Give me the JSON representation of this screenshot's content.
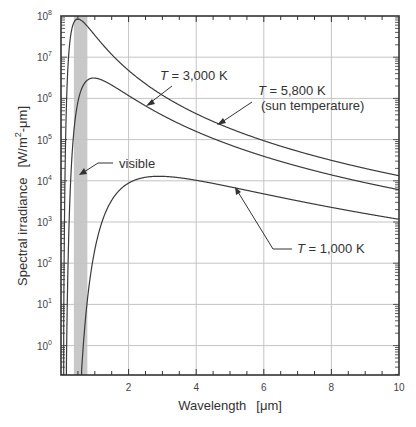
{
  "chart_data": {
    "type": "line",
    "title": "",
    "xlabel": "Wavelength  [μm]",
    "ylabel": "Spectral irradiance  [W/m²-μm]",
    "xscale": "linear",
    "yscale": "log",
    "xlim": [
      0,
      10
    ],
    "ylim": [
      0.2,
      100000000
    ],
    "x_ticks": [
      2,
      4,
      6,
      8,
      10
    ],
    "x_tick_labels": [
      "2",
      "4",
      "6",
      "8",
      "10"
    ],
    "y_ticks": [
      1,
      10,
      100,
      1000,
      10000,
      100000,
      1000000,
      10000000,
      100000000
    ],
    "y_tick_labels": [
      "10^0",
      "10^1",
      "10^2",
      "10^3",
      "10^4",
      "10^5",
      "10^6",
      "10^7",
      "10^8"
    ],
    "grid": true,
    "legend": "none (inline annotations)",
    "series": [
      {
        "name": "T = 5,800 K (sun temperature)",
        "temperature_K": 5800,
        "x": [
          0.2,
          0.3,
          0.4,
          0.5,
          0.6,
          0.8,
          1,
          1.5,
          2,
          3,
          4,
          5,
          6,
          7,
          8,
          9,
          10
        ],
        "values": [
          5200000.0,
          38000000.0,
          61000000.0,
          63000000.0,
          56000000.0,
          37000000.0,
          24000000.0,
          8400000.0,
          3600000.0,
          960000.0,
          360000.0,
          160000.0,
          82000.0,
          46000.0,
          28000.0,
          18000.0,
          12000.0
        ]
      },
      {
        "name": "T = 3,000 K",
        "temperature_K": 3000,
        "x": [
          0.3,
          0.4,
          0.5,
          0.6,
          0.8,
          1,
          1.5,
          2,
          3,
          4,
          5,
          6,
          7,
          8,
          9,
          10
        ],
        "values": [
          50000.0,
          640000.0,
          1800000.0,
          2700000.0,
          3100000.0,
          2600000.0,
          1300000.0,
          650000.0,
          210000.0,
          86000.0,
          41000.0,
          22000.0,
          13000.0,
          8200.0,
          5400.0,
          3700.0
        ]
      },
      {
        "name": "T = 1,000 K",
        "temperature_K": 1000,
        "x": [
          0.6,
          0.8,
          1,
          1.5,
          2,
          2.9,
          3,
          4,
          5,
          6,
          7,
          8,
          9,
          10
        ],
        "values": [
          0.3,
          60,
          700,
          5400.0,
          10000.0,
          12800.0,
          12700.0,
          10500.0,
          7700.0,
          5400.0,
          3900.0,
          2800.0,
          2100.0,
          1600.0
        ]
      }
    ],
    "shaded_regions": [
      {
        "name": "visible",
        "x_range": [
          0.38,
          0.78
        ],
        "color": "#c8c8c8"
      }
    ],
    "annotations": [
      {
        "text": "T = 3,000 K",
        "target_series": "T = 3,000 K"
      },
      {
        "text": "T = 5,800 K",
        "subtext": "(sun temperature)",
        "target_series": "T = 5,800 K (sun temperature)"
      },
      {
        "text": "visible",
        "target": "visible band"
      },
      {
        "text": "T = 1,000 K",
        "target_series": "T = 1,000 K"
      }
    ]
  },
  "labels": {
    "x_axis": "Wavelength",
    "x_unit": "[μm]",
    "y_axis": "Spectral irradiance",
    "y_unit_pre": "[W/m",
    "y_unit_sup": "2",
    "y_unit_post": "-μm]",
    "annot_3000_T": "T",
    "annot_3000_rest": " = 3,000 K",
    "annot_5800_T": "T",
    "annot_5800_rest": " = 5,800 K",
    "annot_5800_sub": "(sun temperature)",
    "annot_visible": "visible",
    "annot_1000_T": "T",
    "annot_1000_rest": " = 1,000 K"
  },
  "colors": {
    "curve": "#3a3a3a",
    "grid": "#c4c4c4",
    "axis": "#333333",
    "visible_band": "#c8c8c8"
  }
}
